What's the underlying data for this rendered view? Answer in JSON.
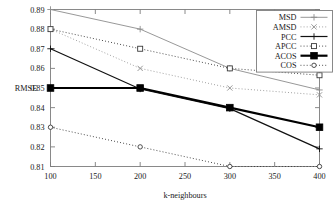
{
  "chart_data": {
    "type": "line",
    "title": "",
    "xlabel": "k-neighbours",
    "ylabel": "RMSE",
    "x": [
      100,
      200,
      300,
      400
    ],
    "xlim": [
      100,
      400
    ],
    "ylim": [
      0.81,
      0.89
    ],
    "xticks": [
      100,
      150,
      200,
      250,
      300,
      350,
      400
    ],
    "xtick_labels": [
      "100",
      "150",
      "200",
      "250",
      "300",
      "350",
      "400"
    ],
    "yticks": [
      0.81,
      0.82,
      0.83,
      0.84,
      0.85,
      0.86,
      0.87,
      0.88,
      0.89
    ],
    "ytick_labels": [
      "0.81",
      "0.82",
      "0.83",
      "0.84",
      "0.85",
      "0.86",
      "0.87",
      "0.88",
      "0.89"
    ],
    "grid": false,
    "legend_position": "top-right",
    "series": [
      {
        "name": "MSD",
        "values": [
          0.89,
          0.88,
          0.86,
          0.849
        ],
        "color": "#8c8c8c",
        "style": "solid",
        "marker": "plus",
        "width": 0.9
      },
      {
        "name": "AMSD",
        "values": [
          0.88,
          0.86,
          0.85,
          0.8465
        ],
        "color": "#8c8c8c",
        "style": "dotted",
        "marker": "cross",
        "width": 0.9
      },
      {
        "name": "PCC",
        "values": [
          0.87,
          0.8495,
          0.8395,
          0.819
        ],
        "color": "#111111",
        "style": "solid",
        "marker": "plus",
        "width": 1.2
      },
      {
        "name": "APCC",
        "values": [
          0.88,
          0.87,
          0.86,
          0.8565
        ],
        "color": "#3a3a3a",
        "style": "dotted",
        "marker": "open-square",
        "width": 1.0
      },
      {
        "name": "ACOS",
        "values": [
          0.85,
          0.85,
          0.84,
          0.83
        ],
        "color": "#000000",
        "style": "solid",
        "marker": "filled-square",
        "width": 2.2
      },
      {
        "name": "COS",
        "values": [
          0.83,
          0.82,
          0.81,
          0.81
        ],
        "color": "#3a3a3a",
        "style": "dotted",
        "marker": "open-circle",
        "width": 1.0
      }
    ]
  },
  "legend": {
    "entries": [
      {
        "label": "MSD"
      },
      {
        "label": "AMSD"
      },
      {
        "label": "PCC"
      },
      {
        "label": "APCC"
      },
      {
        "label": "ACOS"
      },
      {
        "label": "COS"
      }
    ]
  },
  "axes": {
    "y_axis_title": "RMSE",
    "x_axis_title": "k-neighbours"
  },
  "colors": {
    "frame": "#7d7d7d",
    "text": "#1a1a1a",
    "background": "#ffffff"
  }
}
